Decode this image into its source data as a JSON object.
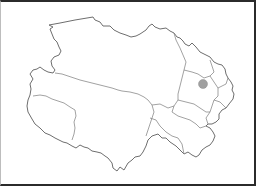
{
  "map": {
    "region": "province outline with prefecture boundaries",
    "colors": {
      "background": "#ffffff",
      "frame": "#2b2b2b",
      "outline": "#6e6e6e",
      "inner_boundaries": "#8a8a8a",
      "marker": "#a0a0a0"
    },
    "marker": {
      "cx": 203,
      "cy": 84,
      "r": 4.5
    }
  }
}
